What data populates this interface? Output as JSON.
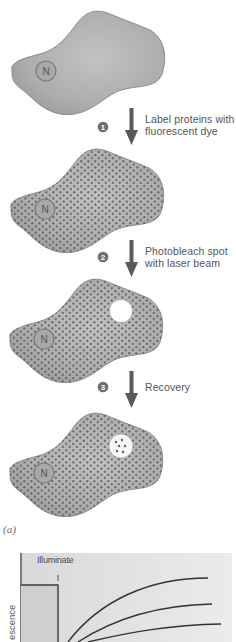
{
  "figure": {
    "panel_label": "(a)",
    "nucleus_label": "N",
    "steps": [
      {
        "number": "1",
        "text_line1": "Label proteins with",
        "text_line2": "fluorescent dye"
      },
      {
        "number": "2",
        "text_line1": "Photobleach spot",
        "text_line2": "with laser beam"
      },
      {
        "number": "3",
        "text_line1": "Recovery",
        "text_line2": ""
      }
    ],
    "cells": [
      {
        "state": "unlabeled"
      },
      {
        "state": "labeled"
      },
      {
        "state": "photobleached"
      },
      {
        "state": "recovered"
      }
    ]
  },
  "chart": {
    "illuminate_label": "Illuminate",
    "y_axis_label": "escence"
  },
  "colors": {
    "cell_fill": "#b3b3b3",
    "cell_edge": "#8c8c8c",
    "dot": "#5e5e5e",
    "arrow": "#5a5a5a",
    "badge": "#6e6e6e",
    "chart_bg": "#e3e3e3",
    "curve": "#3a3a3a"
  }
}
